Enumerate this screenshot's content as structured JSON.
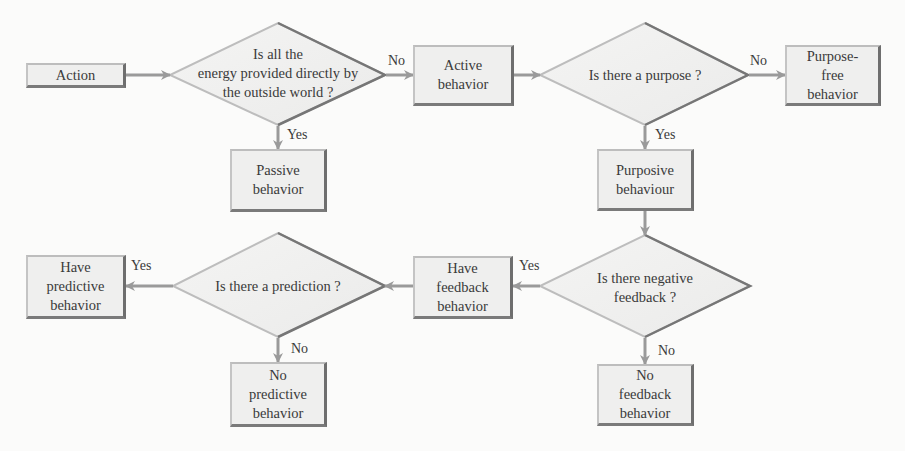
{
  "diagram": {
    "type": "flowchart",
    "colors": {
      "background": "#fbfbfa",
      "box_fill": "#efefee",
      "box_shadow_edge": "#6e6e6e",
      "arrow": "#9a9a9a",
      "text": "#3a3a3a"
    },
    "nodes": {
      "action": {
        "label": "Action",
        "shape": "box"
      },
      "q_energy": {
        "label": "Is all the\nenergy provided directly by\nthe outside world ?",
        "shape": "diamond"
      },
      "passive": {
        "label": "Passive\nbehavior",
        "shape": "box"
      },
      "active": {
        "label": "Active\nbehavior",
        "shape": "box"
      },
      "q_purpose": {
        "label": "Is there a purpose ?",
        "shape": "diamond"
      },
      "purpose_free": {
        "label": "Purpose-\nfree\nbehavior",
        "shape": "box"
      },
      "purposive": {
        "label": "Purposive\nbehaviour",
        "shape": "box"
      },
      "q_neg_feedback": {
        "label": "Is there negative\nfeedback ?",
        "shape": "diamond"
      },
      "no_feedback": {
        "label": "No\nfeedback\nbehavior",
        "shape": "box"
      },
      "have_feedback": {
        "label": "Have\nfeedback\nbehavior",
        "shape": "box"
      },
      "q_prediction": {
        "label": "Is there a prediction ?",
        "shape": "diamond"
      },
      "have_predictive": {
        "label": "Have\npredictive\nbehavior",
        "shape": "box"
      },
      "no_predictive": {
        "label": "No\npredictive\nbehavior",
        "shape": "box"
      }
    },
    "edge_labels": {
      "energy_no": "No",
      "energy_yes": "Yes",
      "purpose_no": "No",
      "purpose_yes": "Yes",
      "neg_feedback_yes": "Yes",
      "neg_feedback_no": "No",
      "prediction_yes": "Yes",
      "prediction_no": "No"
    },
    "edges": [
      {
        "from": "action",
        "to": "q_energy",
        "label": ""
      },
      {
        "from": "q_energy",
        "to": "active",
        "label": "No"
      },
      {
        "from": "q_energy",
        "to": "passive",
        "label": "Yes"
      },
      {
        "from": "active",
        "to": "q_purpose",
        "label": ""
      },
      {
        "from": "q_purpose",
        "to": "purpose_free",
        "label": "No"
      },
      {
        "from": "q_purpose",
        "to": "purposive",
        "label": "Yes"
      },
      {
        "from": "purposive",
        "to": "q_neg_feedback",
        "label": ""
      },
      {
        "from": "q_neg_feedback",
        "to": "have_feedback",
        "label": "Yes"
      },
      {
        "from": "q_neg_feedback",
        "to": "no_feedback",
        "label": "No"
      },
      {
        "from": "have_feedback",
        "to": "q_prediction",
        "label": ""
      },
      {
        "from": "q_prediction",
        "to": "have_predictive",
        "label": "Yes"
      },
      {
        "from": "q_prediction",
        "to": "no_predictive",
        "label": "No"
      }
    ]
  }
}
